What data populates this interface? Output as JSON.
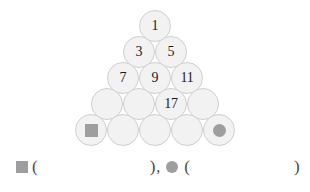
{
  "figure": {
    "type": "number-pyramid",
    "rows": [
      {
        "index": 1,
        "cells": [
          {
            "value": "1"
          }
        ]
      },
      {
        "index": 2,
        "cells": [
          {
            "value": "3"
          },
          {
            "value": "5"
          }
        ]
      },
      {
        "index": 3,
        "cells": [
          {
            "value": "7"
          },
          {
            "value": "9"
          },
          {
            "value": "11"
          }
        ]
      },
      {
        "index": 4,
        "cells": [
          {
            "value": ""
          },
          {
            "value": ""
          },
          {
            "value": "17"
          },
          {
            "value": ""
          }
        ]
      },
      {
        "index": 5,
        "cells": [
          {
            "value": "",
            "marker": "square"
          },
          {
            "value": ""
          },
          {
            "value": ""
          },
          {
            "value": ""
          },
          {
            "value": "",
            "marker": "dot"
          }
        ]
      }
    ]
  },
  "answer_line": {
    "square_icon": "square-marker",
    "dot_icon": "circle-marker",
    "open_paren": "(",
    "close_paren": ")",
    "separator": ",",
    "square_answer": "",
    "dot_answer": ""
  },
  "colors": {
    "ball_fill": "#f2f2f2",
    "ball_stroke": "#cfcfcf",
    "marker": "#9e9e9e",
    "text": "#1b1b1b",
    "background": "#ffffff"
  }
}
